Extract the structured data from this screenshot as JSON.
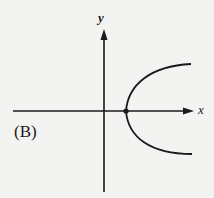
{
  "figure": {
    "option_label": "(B)",
    "x_axis_label": "x",
    "y_axis_label": "y",
    "curve": "parabola opening to the right",
    "vertex_marker": "dot on positive x-axis",
    "line_color": "#1a1a1a",
    "background_color": "#f3f3f1"
  }
}
